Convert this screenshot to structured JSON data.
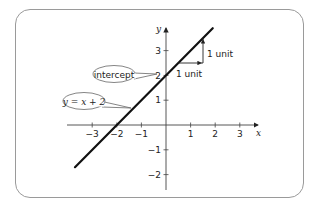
{
  "chart_data": {
    "type": "line",
    "title": "",
    "xlabel": "x",
    "ylabel": "y",
    "xlim": [
      -3.8,
      3.8
    ],
    "ylim": [
      -2.6,
      3.9
    ],
    "grid": false,
    "x_ticks": [
      -3,
      -2,
      -1,
      1,
      2,
      3
    ],
    "y_ticks": [
      -2,
      -1,
      1,
      2,
      3
    ],
    "x_tick_labels": [
      "−3",
      "−2",
      "−1",
      "1",
      "2",
      "3"
    ],
    "y_tick_labels": [
      "−2",
      "−1",
      "1",
      "2",
      "3"
    ],
    "series": [
      {
        "name": "y = x + 2",
        "equation": "y = x + 2",
        "slope": 1,
        "intercept": 2,
        "x": [
          -3.7,
          1.9
        ],
        "y": [
          -1.7,
          3.9
        ]
      }
    ],
    "annotations": [
      {
        "text": "intercept",
        "points_to": [
          0,
          2
        ],
        "shape": "ellipse-callout"
      },
      {
        "text": "y = x + 2",
        "points_to": [
          -1.1,
          0.9
        ],
        "shape": "ellipse-callout"
      },
      {
        "text": "1 unit",
        "type": "run-arrow",
        "from": [
          0.5,
          2.5
        ],
        "to": [
          1.5,
          2.5
        ]
      },
      {
        "text": "1 unit",
        "type": "rise-arrow",
        "from": [
          1.5,
          2.5
        ],
        "to": [
          1.5,
          3.5
        ]
      }
    ]
  },
  "labels": {
    "x_axis": "x",
    "y_axis": "y",
    "callout_intercept": "intercept",
    "callout_equation": "y = x + 2",
    "run_label": "1 unit",
    "rise_label": "1 unit"
  }
}
